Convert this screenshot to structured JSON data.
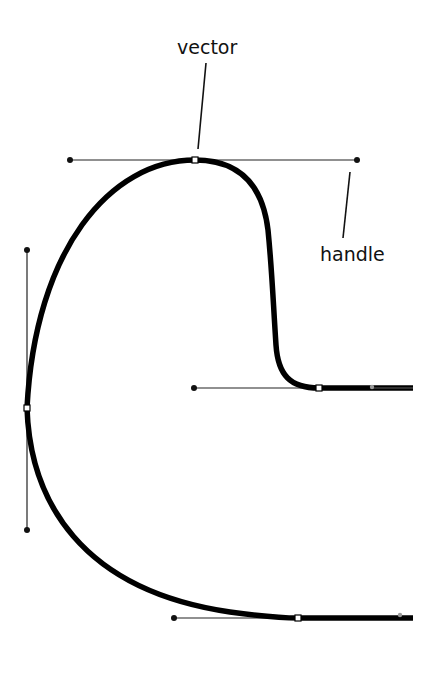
{
  "diagram": {
    "type": "bezier-path-illustration",
    "labels": {
      "vector": "vector",
      "handle": "handle"
    },
    "colors": {
      "stroke": "#000000",
      "handle_line": "#222222",
      "anchor_fill": "#ffffff",
      "background": "#ffffff"
    },
    "anchors": [
      {
        "name": "top",
        "x": 195,
        "y": 160,
        "handles": [
          [
            70,
            160
          ],
          [
            357,
            160
          ]
        ]
      },
      {
        "name": "left",
        "x": 27,
        "y": 408,
        "handles": [
          [
            27,
            250
          ],
          [
            27,
            530
          ]
        ]
      },
      {
        "name": "middle-right",
        "x": 319,
        "y": 388,
        "handles": [
          [
            194,
            388
          ]
        ]
      },
      {
        "name": "bottom",
        "x": 298,
        "y": 618,
        "handles": [
          [
            174,
            618
          ]
        ]
      }
    ]
  }
}
